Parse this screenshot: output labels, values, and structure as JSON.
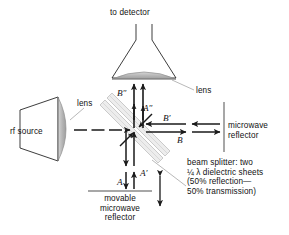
{
  "figure": {
    "background_color": "#ffffff",
    "line_color": "#1a1a1a",
    "gray_fill": "#b0b0b0",
    "light_gray": "#c9c9c9",
    "leader_color": "#9a9a9a"
  },
  "labels": {
    "to_detector": "to detector",
    "lens_top": "lens",
    "lens_left": "lens",
    "rf_source": "rf source",
    "microwave_reflector": "microwave\nreflector",
    "microwave_reflector_line1": "microwave",
    "microwave_reflector_line2": "reflector",
    "movable_reflector_line1": "movable",
    "movable_reflector_line2": "microwave",
    "movable_reflector_line3": "reflector",
    "beam_splitter_line1": "beam splitter: two",
    "beam_splitter_line2": "¼ λ dielectric sheets",
    "beam_splitter_line3": "(50% reflection—",
    "beam_splitter_line4": "50% transmission)"
  },
  "beams": {
    "A": "A",
    "A_prime": "A′",
    "A_double_prime": "A″",
    "B": "B",
    "B_prime": "B′",
    "B_double_prime": "B″"
  },
  "components": {
    "detector_horn": "detector-horn",
    "source_horn": "rf-source-horn",
    "top_lens": "top-lens",
    "source_lens": "source-lens",
    "beam_splitter": "beam-splitter-dielectric-sheets",
    "fixed_reflector": "fixed-microwave-reflector",
    "movable_reflector": "movable-microwave-reflector",
    "travel_arrow": "movable-reflector-travel-arrow"
  }
}
